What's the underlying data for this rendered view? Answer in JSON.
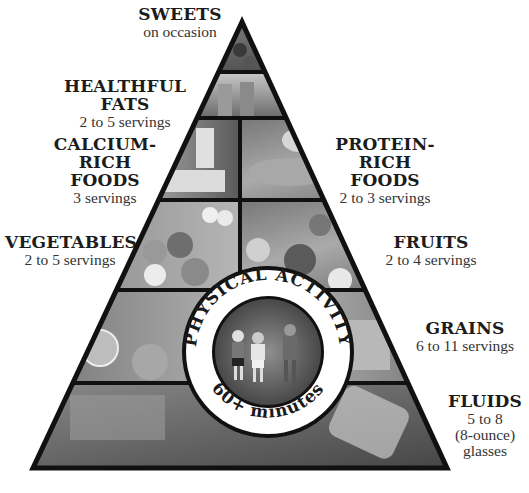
{
  "diagram": {
    "type": "food-pyramid",
    "colors": {
      "outline": "#111111",
      "background": "#ffffff",
      "photo_dark": "#4a4a4a",
      "photo_light": "#bdbdbd"
    },
    "tiers": [
      {
        "name": "SWEETS",
        "servings": "on occasion",
        "side": "left"
      },
      {
        "name": "HEALTHFUL FATS",
        "servings": "2 to 5 servings",
        "side": "left"
      },
      {
        "name_line1": "CALCIUM-RICH",
        "name_line2": "FOODS",
        "servings": "3 servings",
        "side": "left"
      },
      {
        "name_line1": "PROTEIN-RICH",
        "name_line2": "FOODS",
        "servings": "2 to 3 servings",
        "side": "right"
      },
      {
        "name": "VEGETABLES",
        "servings": "2 to 5 servings",
        "side": "left"
      },
      {
        "name": "FRUITS",
        "servings": "2 to 4 servings",
        "side": "right"
      },
      {
        "name": "GRAINS",
        "servings": "6 to 11 servings",
        "side": "right"
      },
      {
        "name": "FLUIDS",
        "servings_line1": "5 to 8",
        "servings_line2": "(8-ounce)",
        "servings_line3": "glasses",
        "side": "right"
      }
    ],
    "center_badge": {
      "top_text": "PHYSICAL ACTIVITY",
      "bottom_text": "60+ minutes"
    }
  }
}
